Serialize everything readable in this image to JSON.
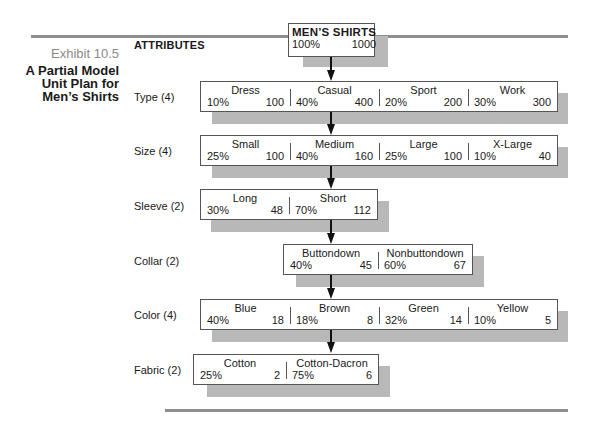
{
  "exhibit": {
    "number": "Exhibit 10.5",
    "title_lines": [
      "A Partial Model",
      "Unit Plan for",
      "Men’s Shirts"
    ]
  },
  "attributes_heading": "ATTRIBUTES",
  "root": {
    "name": "MEN’S SHIRTS",
    "percent": "100%",
    "count": "1000"
  },
  "levels": [
    {
      "label": "Type (4)",
      "items": [
        {
          "name": "Dress",
          "percent": "10%",
          "count": "100"
        },
        {
          "name": "Casual",
          "percent": "40%",
          "count": "400"
        },
        {
          "name": "Sport",
          "percent": "20%",
          "count": "200"
        },
        {
          "name": "Work",
          "percent": "30%",
          "count": "300"
        }
      ]
    },
    {
      "label": "Size (4)",
      "items": [
        {
          "name": "Small",
          "percent": "25%",
          "count": "100"
        },
        {
          "name": "Medium",
          "percent": "40%",
          "count": "160"
        },
        {
          "name": "Large",
          "percent": "25%",
          "count": "100"
        },
        {
          "name": "X-Large",
          "percent": "10%",
          "count": "40"
        }
      ]
    },
    {
      "label": "Sleeve (2)",
      "items": [
        {
          "name": "Long",
          "percent": "30%",
          "count": "48"
        },
        {
          "name": "Short",
          "percent": "70%",
          "count": "112"
        }
      ]
    },
    {
      "label": "Collar (2)",
      "items": [
        {
          "name": "Buttondown",
          "percent": "40%",
          "count": "45"
        },
        {
          "name": "Nonbuttondown",
          "percent": "60%",
          "count": "67"
        }
      ]
    },
    {
      "label": "Color (4)",
      "items": [
        {
          "name": "Blue",
          "percent": "40%",
          "count": "18"
        },
        {
          "name": "Brown",
          "percent": "18%",
          "count": "8"
        },
        {
          "name": "Green",
          "percent": "32%",
          "count": "14"
        },
        {
          "name": "Yellow",
          "percent": "10%",
          "count": "5"
        }
      ]
    },
    {
      "label": "Fabric (2)",
      "items": [
        {
          "name": "Cotton",
          "percent": "25%",
          "count": "2"
        },
        {
          "name": "Cotton-Dacron",
          "percent": "75%",
          "count": "6"
        }
      ]
    }
  ],
  "colors": {
    "rule": "#8e8e8e",
    "shadow": "#b8b8b8",
    "border": "#555555",
    "exhibit_number": "#8a8a8a"
  }
}
